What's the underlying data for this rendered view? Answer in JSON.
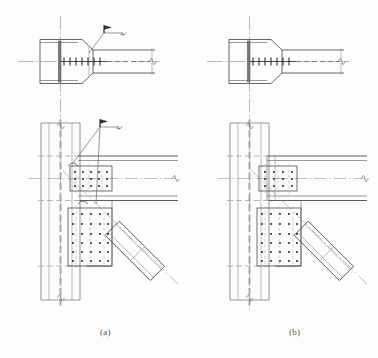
{
  "figure": {
    "kind": "engineering-drawing",
    "discipline": "structural-steel",
    "title_visible": false,
    "background_color": "#fdfdfb",
    "line_color": "#4a4a4a",
    "thin_line_color": "#8e8e8e",
    "centerline_color": "#9a9a9a",
    "hidden_line_color": "#a8a8a8",
    "bolt_color": "#3c3c3c"
  },
  "captions": [
    {
      "id": "a",
      "label": "(a)",
      "x": 100,
      "y": 327
    },
    {
      "id": "b",
      "label": "(b)",
      "x": 289,
      "y": 327
    }
  ],
  "panels": [
    {
      "id": "a",
      "caption": "(a)",
      "origin_x": 0,
      "has_weld_callouts": true,
      "weld_callout_count": 2,
      "views": [
        {
          "name": "plan-section",
          "type": "plan",
          "position": "top",
          "members": [
            "column-i-section",
            "end-plate-chamfered",
            "beam-stub"
          ],
          "bolt_line_marks": 9,
          "break_symbol": true,
          "centerline_vertical": true,
          "centerline_horizontal": true
        },
        {
          "name": "elevation",
          "type": "elevation",
          "position": "bottom",
          "members": [
            "column",
            "beam",
            "upper-splice-plate",
            "lower-gusset-plate",
            "diagonal-brace"
          ],
          "break_symbol": true
        }
      ],
      "bolt_groups": [
        {
          "name": "upper-splice-bolts",
          "rows": 3,
          "cols": 5,
          "count": 15
        },
        {
          "name": "lower-gusset-bolts",
          "rows": 6,
          "cols": 5,
          "count": 30
        }
      ],
      "brace": {
        "name": "diagonal-brace",
        "angle_deg": 45,
        "shape": "tube"
      }
    },
    {
      "id": "b",
      "caption": "(b)",
      "origin_x": 189,
      "has_weld_callouts": false,
      "weld_callout_count": 0,
      "views": [
        {
          "name": "plan-section",
          "type": "plan",
          "position": "top",
          "members": [
            "column-i-section",
            "end-plate-chamfered",
            "beam-stub"
          ],
          "bolt_line_marks": 9,
          "break_symbol": true,
          "centerline_vertical": true,
          "centerline_horizontal": true
        },
        {
          "name": "elevation",
          "type": "elevation",
          "position": "bottom",
          "members": [
            "column",
            "beam",
            "upper-splice-plate",
            "lower-gusset-plate",
            "diagonal-brace"
          ],
          "break_symbol": true
        }
      ],
      "bolt_groups": [
        {
          "name": "upper-splice-bolts",
          "rows": 3,
          "cols": 4,
          "count": 12
        },
        {
          "name": "lower-gusset-bolts",
          "rows": 6,
          "cols": 5,
          "count": 30
        }
      ],
      "brace": {
        "name": "diagonal-brace",
        "angle_deg": 45,
        "shape": "tube"
      }
    }
  ],
  "annotations": {
    "weld_symbol_name": "field-weld-flag-symbol",
    "break_symbol_name": "break-line-symbol",
    "leader_name": "leader-line"
  }
}
